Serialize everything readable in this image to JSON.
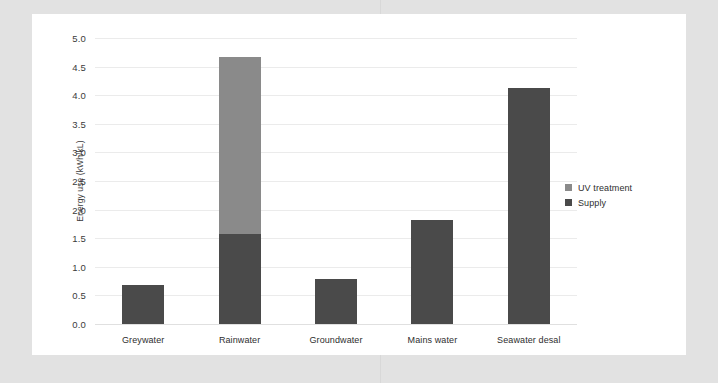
{
  "chart_data": {
    "type": "bar",
    "subtype": "stacked-bar",
    "title": "",
    "xlabel": "",
    "ylabel": "Energy use (kWh/kL)",
    "ylim": [
      0.0,
      5.0
    ],
    "ytick_labels": [
      "5.0",
      "4.5",
      "4.0",
      "3.5",
      "3.0",
      "2.5",
      "2.0",
      "1.5",
      "1.0",
      "0.5",
      "0.0"
    ],
    "ytick_values": [
      5.0,
      4.5,
      4.0,
      3.5,
      3.0,
      2.5,
      2.0,
      1.5,
      1.0,
      0.5,
      0.0
    ],
    "grid": true,
    "grid_axis": "y",
    "legend_position": "right",
    "categories": [
      "Greywater",
      "Rainwater",
      "Groundwater",
      "Mains water",
      "Seawater desal"
    ],
    "series": [
      {
        "name": "Supply",
        "color": "#4a4a4a",
        "values": [
          0.68,
          1.57,
          0.79,
          1.81,
          4.12
        ]
      },
      {
        "name": "UV treatment",
        "color": "#8a8a8a",
        "values": [
          0.0,
          3.1,
          0.0,
          0.0,
          0.0
        ]
      }
    ],
    "totals": [
      0.68,
      4.67,
      0.79,
      1.81,
      4.12
    ]
  },
  "legend": {
    "items": [
      {
        "label": "UV treatment",
        "color": "#8a8a8a"
      },
      {
        "label": "Supply",
        "color": "#4a4a4a"
      }
    ]
  },
  "colors": {
    "page_background": "#e2e2e2",
    "panel_background": "#ffffff",
    "gridline": "#ebebeb",
    "text": "#2e2e2e"
  }
}
